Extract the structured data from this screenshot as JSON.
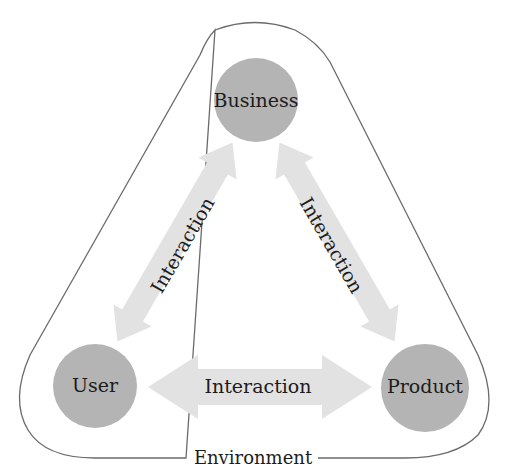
{
  "diagram": {
    "nodes": [
      {
        "id": "business",
        "label": "Business"
      },
      {
        "id": "user",
        "label": "User"
      },
      {
        "id": "product",
        "label": "Product"
      }
    ],
    "edges": [
      {
        "from": "user",
        "to": "business",
        "label": "Interaction",
        "bidirectional": true
      },
      {
        "from": "business",
        "to": "product",
        "label": "Interaction",
        "bidirectional": true
      },
      {
        "from": "user",
        "to": "product",
        "label": "Interaction",
        "bidirectional": true
      }
    ],
    "boundary_label": "Environment",
    "colors": {
      "node_fill": "#b4b4b4",
      "arrow_fill": "#e2e2e2",
      "outline": "#6a6a6a",
      "text": "#1c1c1c"
    }
  }
}
